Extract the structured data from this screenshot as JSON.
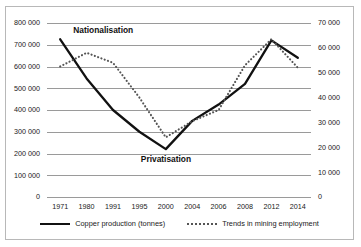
{
  "chart_data": {
    "type": "line",
    "title": "",
    "xlabel": "",
    "ylabel": "",
    "grid": true,
    "legend_position": "bottom",
    "categories": [
      "1971",
      "1980",
      "1991",
      "1995",
      "2000",
      "2004",
      "2006",
      "2008",
      "2012",
      "2014"
    ],
    "axes": {
      "left": {
        "label": "Copper production (tonnes)",
        "ylim": [
          0,
          800000
        ],
        "tick_step": 100000,
        "ticks": [
          "0",
          "100 000",
          "200 000",
          "300 000",
          "400 000",
          "500 000",
          "600 000",
          "700 000",
          "800 000"
        ]
      },
      "right": {
        "label": "Trends in mining employment",
        "ylim": [
          0,
          70000
        ],
        "tick_step": 10000,
        "ticks": [
          "0",
          "10 000",
          "20 000",
          "30 000",
          "40 000",
          "50 000",
          "60 000",
          "70 000"
        ]
      }
    },
    "series": [
      {
        "name": "Copper production (tonnes)",
        "axis": "left",
        "style": "solid",
        "color": "#111111",
        "values": [
          725000,
          545000,
          400000,
          300000,
          220000,
          350000,
          425000,
          520000,
          720000,
          640000
        ]
      },
      {
        "name": "Trends in mining employment",
        "axis": "right",
        "style": "dotted",
        "color": "#555555",
        "values": [
          52500,
          58000,
          54000,
          40000,
          24000,
          30500,
          35000,
          53000,
          63500,
          52000
        ]
      }
    ],
    "annotations": [
      {
        "text": "Nationalisation",
        "near_category": "1971",
        "value": 770000
      },
      {
        "text": "Privatisation",
        "near_category": "2000",
        "value": 175000
      }
    ]
  },
  "legend": {
    "items": [
      {
        "label": "Copper production (tonnes)",
        "style": "solid"
      },
      {
        "label": "Trends in mining employment",
        "style": "dotted"
      }
    ]
  }
}
